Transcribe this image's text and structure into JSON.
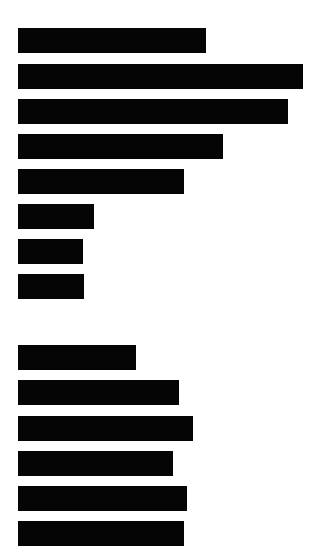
{
  "document": {
    "background_color": "#ffffff",
    "redaction_color": "#050505",
    "sections": [
      {
        "name": "section-1",
        "lines": [
          {
            "text": "[REDACTED]",
            "x": 18,
            "y": 28,
            "width": 188
          },
          {
            "text": "[REDACTED]",
            "x": 18,
            "y": 64,
            "width": 285
          },
          {
            "text": "[REDACTED]",
            "x": 18,
            "y": 99,
            "width": 270
          },
          {
            "text": "[REDACTED]",
            "x": 18,
            "y": 134,
            "width": 205
          },
          {
            "text": "[REDACTED]",
            "x": 18,
            "y": 169,
            "width": 166
          },
          {
            "text": "[REDACTED]",
            "x": 18,
            "y": 204,
            "width": 76
          },
          {
            "text": "[REDACTED]",
            "x": 18,
            "y": 239,
            "width": 65
          },
          {
            "text": "[REDACTED]",
            "x": 18,
            "y": 274,
            "width": 66
          }
        ]
      },
      {
        "name": "section-2",
        "lines": [
          {
            "text": "[REDACTED]",
            "x": 18,
            "y": 345,
            "width": 118
          },
          {
            "text": "[REDACTED]",
            "x": 18,
            "y": 380,
            "width": 161
          },
          {
            "text": "[REDACTED]",
            "x": 18,
            "y": 416,
            "width": 175
          },
          {
            "text": "[REDACTED]",
            "x": 18,
            "y": 451,
            "width": 155
          },
          {
            "text": "[REDACTED]",
            "x": 18,
            "y": 486,
            "width": 169
          },
          {
            "text": "[REDACTED]",
            "x": 18,
            "y": 521,
            "width": 166
          }
        ]
      }
    ]
  }
}
